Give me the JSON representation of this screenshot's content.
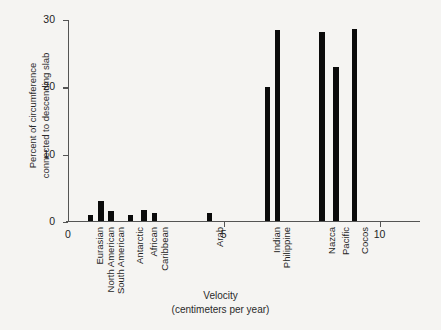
{
  "chart_data": {
    "type": "bar",
    "title": "",
    "xlabel": "Velocity",
    "xlabel_sub": "(centimeters per year)",
    "ylabel_line1": "Percent of circumference",
    "ylabel_line2": "connected to descending slab",
    "ylim": [
      0,
      30
    ],
    "yticks": [
      0,
      10,
      20,
      30
    ],
    "ytick_labels": [
      "0",
      "10",
      "20",
      "30"
    ],
    "xlim": [
      0,
      11.3
    ],
    "xticks": [
      0,
      5,
      10
    ],
    "xtick_labels": [
      "0",
      "5",
      "10"
    ],
    "grid": false,
    "legend": null,
    "bar_color": "#0b0b0b",
    "categories": [
      "Eurasian",
      "North American",
      "South American",
      "Antarctic",
      "African",
      "Caribbean",
      "Arab",
      "Indian",
      "Philippine",
      "Nazca",
      "Pacific",
      "Cocos"
    ],
    "x": [
      0.72,
      1.05,
      1.38,
      2.0,
      2.45,
      2.78,
      4.55,
      6.4,
      6.72,
      8.15,
      8.6,
      9.2
    ],
    "values": [
      1.0,
      3.1,
      1.6,
      1.0,
      1.7,
      1.2,
      1.2,
      20.0,
      28.4,
      28.1,
      23.0,
      28.6
    ],
    "bar_widths": [
      0.17,
      0.2,
      0.17,
      0.15,
      0.19,
      0.16,
      0.17,
      0.16,
      0.18,
      0.17,
      0.17,
      0.17
    ]
  },
  "figure": {
    "background_color": "#f5f4f2",
    "axis_color": "#545454"
  }
}
